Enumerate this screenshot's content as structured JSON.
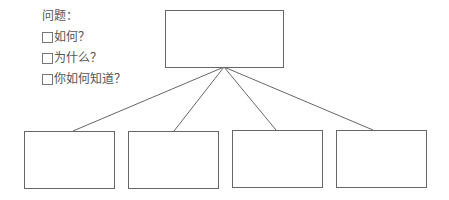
{
  "questions": {
    "title": "问题：",
    "items": [
      {
        "label": "如何？",
        "checked": false
      },
      {
        "label": "为什么？",
        "checked": false
      },
      {
        "label": "你如何知道？",
        "checked": false
      }
    ]
  },
  "diagram": {
    "line_color": "#555555",
    "box_border_color": "#666666",
    "top_box": {
      "x": 165,
      "y": 10,
      "width": 118,
      "height": 57,
      "text": ""
    },
    "junction": {
      "x": 224,
      "y": 67
    },
    "bottom_boxes": [
      {
        "x": 24,
        "y": 131,
        "width": 90,
        "height": 57,
        "connect_x": 73,
        "text": ""
      },
      {
        "x": 128,
        "y": 131,
        "width": 90,
        "height": 57,
        "connect_x": 174,
        "text": ""
      },
      {
        "x": 232,
        "y": 130,
        "width": 90,
        "height": 57,
        "connect_x": 276,
        "text": ""
      },
      {
        "x": 336,
        "y": 130,
        "width": 90,
        "height": 57,
        "connect_x": 373,
        "text": ""
      }
    ]
  }
}
